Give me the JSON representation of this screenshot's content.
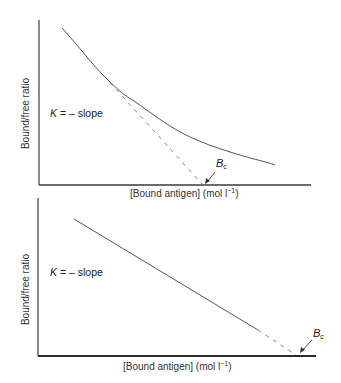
{
  "figure": {
    "panels": [
      {
        "id": "top",
        "plot_type": "Scatchard plot (curved, heterogeneous binding)",
        "y_label": "Bound/free ratio",
        "x_label_main": "[Bound antigen] (mol l",
        "x_label_sup": "−1",
        "x_label_close": ")",
        "annotation_k": "K",
        "annotation_rest": " = – slope",
        "bc_main": "B",
        "bc_sub": "c",
        "curve_style": "solid curve with dashed tangent extrapolation to x-axis"
      },
      {
        "id": "bottom",
        "plot_type": "Scatchard plot (linear, homogeneous binding)",
        "y_label": "Bound/free ratio",
        "x_label_main": "[Bound antigen] (mol l",
        "x_label_sup": "−1",
        "x_label_close": ")",
        "annotation_k": "K",
        "annotation_rest": " = – slope",
        "bc_main": "B",
        "bc_sub": "c",
        "curve_style": "solid straight line with short dashed extrapolation to x-axis"
      }
    ],
    "colors": {
      "axis": "#3a3a3a",
      "curve": "#555555",
      "dashed": "#777777",
      "text": "#2a2a2a"
    }
  }
}
